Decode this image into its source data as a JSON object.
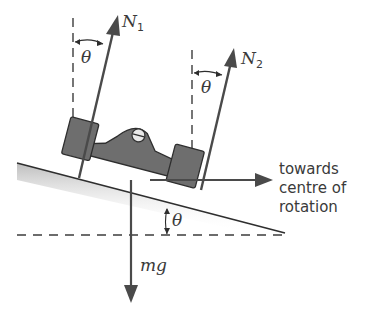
{
  "diagram": {
    "colors": {
      "arrow": "#4a4a4a",
      "car_body": "#6e6e6e",
      "car_outline": "#2e2e2e",
      "road_shadow": "#cfcfcf",
      "dashed": "#3c3c3c",
      "text": "#3a3a3a"
    },
    "forces": {
      "n1": {
        "label": "N",
        "subscript": "1"
      },
      "n2": {
        "label": "N",
        "subscript": "2"
      },
      "weight": {
        "label": "mg"
      },
      "horizontal": {
        "label_lines": [
          "towards",
          "centre of",
          "rotation"
        ]
      }
    },
    "angles": {
      "theta_n1": "θ",
      "theta_n2": "θ",
      "theta_slope": "θ"
    }
  }
}
